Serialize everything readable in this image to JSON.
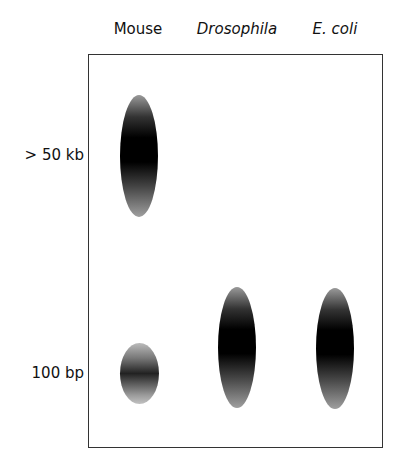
{
  "figure": {
    "lanes": [
      {
        "label": "Mouse",
        "italic": false
      },
      {
        "label": "Drosophila",
        "italic": true
      },
      {
        "label": "E. coli",
        "italic": true
      }
    ],
    "size_markers": [
      {
        "label": "> 50 kb"
      },
      {
        "label": "100 bp"
      }
    ],
    "bands": [
      {
        "lane": "Mouse",
        "position": "> 50 kb",
        "type": "large smear"
      },
      {
        "lane": "Mouse",
        "position": "100 bp",
        "type": "small band"
      },
      {
        "lane": "Drosophila",
        "position": "100 bp",
        "type": "smear"
      },
      {
        "lane": "E. coli",
        "position": "100 bp",
        "type": "smear"
      }
    ]
  }
}
